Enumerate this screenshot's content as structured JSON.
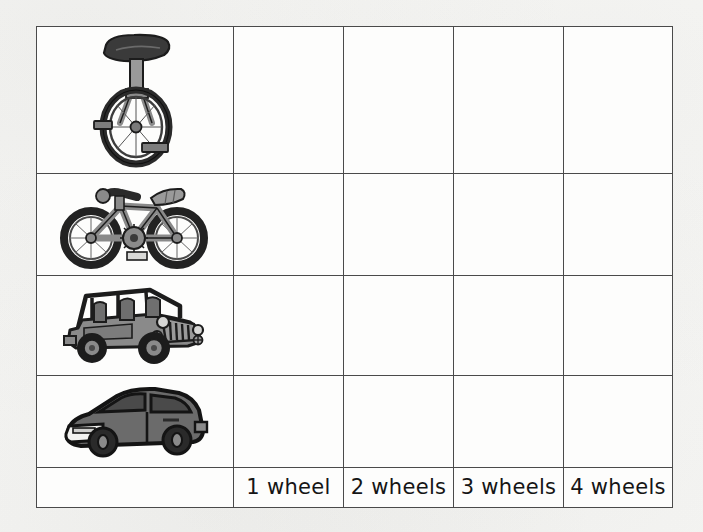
{
  "worksheet": {
    "background_color": "#f7f7f5",
    "grid_line_color": "#4a4a4a",
    "cell_background": "#fdfdfc",
    "columns": [
      {
        "key": "vehicle_picture",
        "label": ""
      },
      {
        "key": "one_wheel",
        "label": "1 wheel"
      },
      {
        "key": "two_wheels",
        "label": "2 wheels"
      },
      {
        "key": "three_wheels",
        "label": "3 wheels"
      },
      {
        "key": "four_wheels",
        "label": "4 wheels"
      }
    ],
    "rows": [
      {
        "picture": "unicycle-illustration",
        "alt": "unicycle",
        "cells": [
          "",
          "",
          "",
          ""
        ]
      },
      {
        "picture": "bicycle-illustration",
        "alt": "bicycle",
        "cells": [
          "",
          "",
          "",
          ""
        ]
      },
      {
        "picture": "jeep-illustration",
        "alt": "jeep",
        "cells": [
          "",
          "",
          "",
          ""
        ]
      },
      {
        "picture": "car-illustration",
        "alt": "car",
        "cells": [
          "",
          "",
          "",
          ""
        ]
      }
    ],
    "footer_row": {
      "picture_cell": "",
      "labels": [
        "1 wheel",
        "2 wheels",
        "3 wheels",
        "4 wheels"
      ]
    },
    "colors": {
      "ink": "#151515",
      "outline": "#1c1c1c",
      "unicycle_saddle": "#3a3a3a",
      "unicycle_post": "#8f8f8f",
      "bike_frame": "#8a8a8a",
      "tire": "#2a2a2a",
      "jeep_body": "#8a8a8a",
      "jeep_shadow": "#6a6a6a",
      "car_body": "#6b6b6b",
      "car_window": "#4a4a4a",
      "car_bumper": "#f2f2f0"
    }
  }
}
